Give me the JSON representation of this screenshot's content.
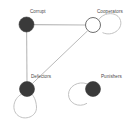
{
  "figure": {
    "type": "network-diagram",
    "width": 136,
    "height": 124,
    "background_color": "#ffffff"
  },
  "style": {
    "node_fill_dark": "#3a3a3a",
    "node_fill_light": "#ffffff",
    "node_stroke": "#6f6f6f",
    "edge_color": "#b9b9b9",
    "loop_color": "#c2c2c2",
    "label_color": "#4a4a4a"
  },
  "nodes": [
    {
      "id": "corrupt",
      "label": "Corrupt",
      "cx": 26.5,
      "cy": 24.5,
      "r": 7.5,
      "fill": "dark",
      "self_loop": false
    },
    {
      "id": "cooperators",
      "label": "Cooperators",
      "cx": 93,
      "cy": 25,
      "r": 7.5,
      "fill": "light",
      "self_loop": true
    },
    {
      "id": "defectors",
      "label": "Defectors",
      "cx": 27,
      "cy": 89,
      "r": 7.5,
      "fill": "dark",
      "self_loop": true
    },
    {
      "id": "punishers",
      "label": "Punishers",
      "cx": 93,
      "cy": 89,
      "r": 7.5,
      "fill": "dark",
      "self_loop": true
    }
  ],
  "edges": [
    {
      "from": "corrupt",
      "to": "cooperators",
      "kind": "straight"
    },
    {
      "from": "corrupt",
      "to": "defectors",
      "kind": "straight"
    },
    {
      "from": "cooperators",
      "to": "defectors",
      "kind": "straight"
    }
  ],
  "self_loops": [
    {
      "node": "cooperators",
      "direction": "up-right"
    },
    {
      "node": "defectors",
      "direction": "down-left"
    },
    {
      "node": "punishers",
      "direction": "left"
    }
  ]
}
